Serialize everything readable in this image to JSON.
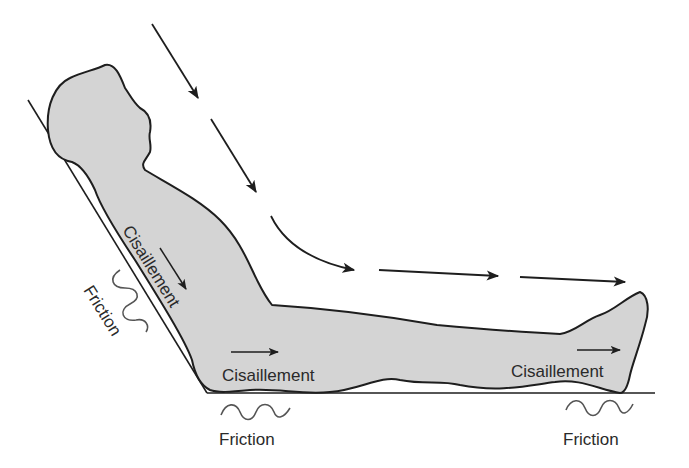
{
  "diagram": {
    "colors": {
      "body_fill": "#d4d4d4",
      "outline": "#1e1e1e",
      "friction_wave": "#555555",
      "text": "#2a2a2a",
      "background": "#ffffff"
    },
    "labels": {
      "shear_back": "Cisaillement",
      "shear_buttocks": "Cisaillement",
      "shear_heel": "Cisaillement",
      "friction_back": "Friction",
      "friction_buttocks": "Friction",
      "friction_heel": "Friction"
    },
    "arrows": {
      "gravity_path": "downward-then-forward sliding direction",
      "count": 7
    }
  }
}
